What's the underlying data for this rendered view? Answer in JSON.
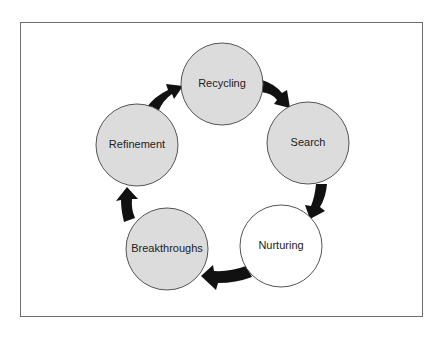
{
  "diagram": {
    "type": "cycle",
    "colors": {
      "frame_border": "#6e6e6e",
      "node_fill_gray": "#dcdcdc",
      "node_fill_white": "#ffffff",
      "node_stroke": "#555555",
      "arrow": "#111111"
    },
    "nodes": [
      {
        "id": "recycling",
        "label": "Recycling",
        "fill": "gray"
      },
      {
        "id": "search",
        "label": "Search",
        "fill": "gray"
      },
      {
        "id": "nurturing",
        "label": "Nurturing",
        "fill": "white"
      },
      {
        "id": "breakthroughs",
        "label": "Breakthroughs",
        "fill": "gray"
      },
      {
        "id": "refinement",
        "label": "Refinement",
        "fill": "gray"
      }
    ],
    "edges": [
      {
        "from": "refinement",
        "to": "recycling"
      },
      {
        "from": "recycling",
        "to": "search"
      },
      {
        "from": "search",
        "to": "nurturing"
      },
      {
        "from": "nurturing",
        "to": "breakthroughs"
      },
      {
        "from": "breakthroughs",
        "to": "refinement"
      }
    ]
  }
}
